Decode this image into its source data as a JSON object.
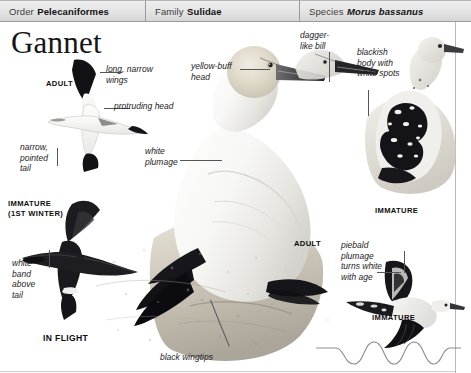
{
  "header": {
    "columns": [
      {
        "rank": "Order",
        "name": "Pelecaniformes",
        "italic": false
      },
      {
        "rank": "Family",
        "name": "Sulidae",
        "italic": false
      },
      {
        "rank": "Species",
        "name": "Morus bassanus",
        "italic": true
      }
    ]
  },
  "title": "Gannet",
  "captions": {
    "adult_flight": "ADULT",
    "immature_first_winter": "IMMATURE\n(1ST WINTER)",
    "in_flight": "IN FLIGHT",
    "adult_perched": "ADULT",
    "immature_perched": "IMMATURE",
    "immature_flight": "IMMATURE"
  },
  "annotations": {
    "long_narrow_wings": "long, narrow\nwings",
    "protruding_head": "protruding head",
    "narrow_pointed_tail": "narrow,\npointed\ntail",
    "white_band_above_tail": "white\nband\nabove\ntail",
    "yellow_buff_head": "yellow-buff\nhead",
    "white_plumage": "white\nplumage",
    "dagger_like_bill": "dagger-\nlike bill",
    "blackish_body_white_spots": "blackish\nbody with\nwhite spots",
    "piebald_plumage": "piebald\nplumage\nturns white\nwith age",
    "black_wingtips": "black wingtips"
  },
  "colors": {
    "header_bg": "#e3e3e3",
    "header_border": "#9a9a9a",
    "rule": "#b9b9b9",
    "text": "#1d1d1d",
    "leader": "#55555a",
    "plumage_dark": "#111111",
    "plumage_light": "#f3f3f1",
    "rock": "#cfcac2",
    "head_buff": "#d8d2c4"
  },
  "flight_path": {
    "label": "undulating-flight-path",
    "cycles": 3
  }
}
